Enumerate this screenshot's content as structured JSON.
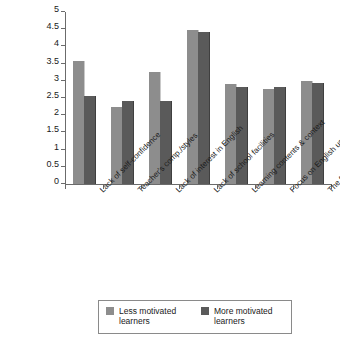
{
  "chart_data": {
    "type": "bar",
    "title": "",
    "subtitle": "",
    "xlabel": "",
    "ylabel": "",
    "ylim": [
      0,
      5
    ],
    "ytick_labels": [
      "0",
      "0.5",
      "1",
      "1.5",
      "2",
      "2.5",
      "3",
      "3.5",
      "4",
      "4.5",
      "5"
    ],
    "ytick_values": [
      0,
      0.5,
      1,
      1.5,
      2,
      2.5,
      3,
      3.5,
      4,
      4.5,
      5
    ],
    "grid": false,
    "legend_position": "bottom",
    "categories": [
      "Lack of self-confidence",
      "Teacher's comp./styles",
      "Lack of interest in English",
      "Lack of school facilities",
      "Learning contents & context",
      "Focus on English usage",
      "The focus of teaching"
    ],
    "series": [
      {
        "name": "Less motivated learners",
        "color": "#8d8d8d",
        "values": [
          3.57,
          2.25,
          3.27,
          4.47,
          2.92,
          2.76,
          3.0
        ]
      },
      {
        "name": "More motivated learners",
        "color": "#5a5a5a",
        "values": [
          2.55,
          2.41,
          2.42,
          4.42,
          2.83,
          2.83,
          2.93
        ]
      }
    ]
  },
  "legend": {
    "items": [
      {
        "label": "Less motivated learners",
        "color": "#8d8d8d"
      },
      {
        "label": "More motivated learners",
        "color": "#5a5a5a"
      }
    ]
  },
  "colors": {
    "axis": "#6b6b6b",
    "text": "#1a1a1a",
    "background": "#ffffff",
    "legend_border": "#8a8a8a"
  }
}
